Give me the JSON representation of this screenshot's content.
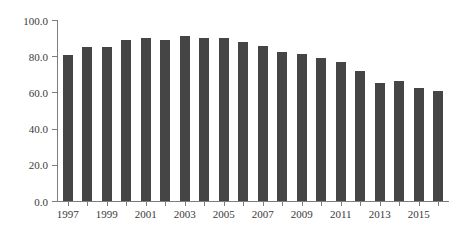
{
  "chart_data": {
    "type": "bar",
    "title": "",
    "subtitle": "",
    "xlabel": "",
    "ylabel": "",
    "grid": false,
    "legend": null,
    "ylim": [
      0.0,
      100.0
    ],
    "ytick_labels": [
      "100.0",
      "80.0",
      "60.0",
      "40.0",
      "20.0",
      "0.0"
    ],
    "ytick_values": [
      100.0,
      80.0,
      60.0,
      40.0,
      20.0,
      0.0
    ],
    "categories": [
      "1997",
      "1998",
      "1999",
      "2000",
      "2001",
      "2002",
      "2003",
      "2004",
      "2005",
      "2006",
      "2007",
      "2008",
      "2009",
      "2010",
      "2011",
      "2012",
      "2013",
      "2014",
      "2015",
      "2016"
    ],
    "xtick_labels_shown": [
      "1997",
      "1999",
      "2001",
      "2003",
      "2005",
      "2007",
      "2009",
      "2011",
      "2013",
      "2015"
    ],
    "values": [
      80.5,
      85.3,
      85.3,
      89.0,
      89.8,
      89.0,
      91.0,
      90.2,
      90.0,
      87.6,
      85.4,
      82.3,
      81.4,
      78.8,
      76.9,
      71.6,
      65.2,
      66.4,
      62.7,
      60.7
    ],
    "bar_color": "#454545",
    "axis_color": "#7d7d7d",
    "text_color": "#3a3a3a",
    "background_color": "#ffffff"
  }
}
